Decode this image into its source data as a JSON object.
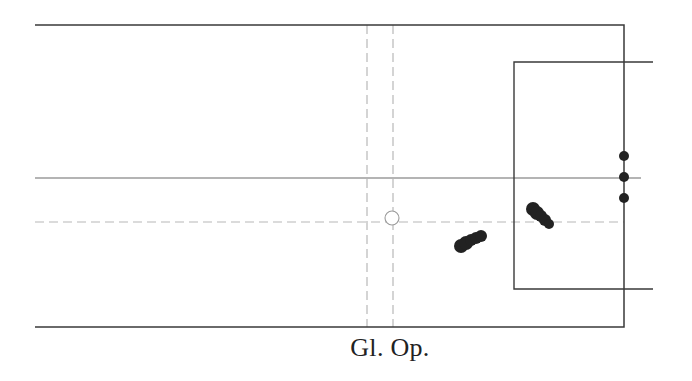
{
  "diagram": {
    "type": "pitch-half-diagram",
    "caption": "Gl. Op.",
    "colors": {
      "line": "#3a3a3a",
      "dashed": "#b8b8b8",
      "marker": "#222222",
      "circle": "#9a9a9a",
      "background": "#ffffff"
    },
    "outer_boundary": {
      "left": 35,
      "top": 25,
      "right": 624,
      "bottom": 327
    },
    "inner_box": {
      "left": 514,
      "top": 62,
      "bottom": 289,
      "extend_right": 653
    },
    "center_line": {
      "y": 178,
      "x1": 35,
      "x2": 641
    },
    "dashed_horizontal": {
      "y": 222,
      "x1": 35,
      "x2": 624
    },
    "dashed_verticals": [
      {
        "x": 367
      },
      {
        "x": 393
      }
    ],
    "reference_circle": {
      "cx": 392,
      "cy": 218,
      "r": 7
    },
    "goal_markers": [
      {
        "cx": 624,
        "cy": 156,
        "r": 5
      },
      {
        "cx": 624,
        "cy": 177,
        "r": 5
      },
      {
        "cx": 624,
        "cy": 198,
        "r": 5
      }
    ],
    "clusters": [
      {
        "name": "cluster-left",
        "points": [
          {
            "cx": 461,
            "cy": 246,
            "r": 7
          },
          {
            "cx": 466,
            "cy": 243,
            "r": 7
          },
          {
            "cx": 471,
            "cy": 240,
            "r": 6
          },
          {
            "cx": 476,
            "cy": 238,
            "r": 6
          },
          {
            "cx": 481,
            "cy": 236,
            "r": 6
          }
        ]
      },
      {
        "name": "cluster-right",
        "points": [
          {
            "cx": 533,
            "cy": 209,
            "r": 7
          },
          {
            "cx": 537,
            "cy": 213,
            "r": 7
          },
          {
            "cx": 541,
            "cy": 216,
            "r": 6
          },
          {
            "cx": 545,
            "cy": 220,
            "r": 6
          },
          {
            "cx": 549,
            "cy": 224,
            "r": 5
          }
        ]
      }
    ]
  }
}
